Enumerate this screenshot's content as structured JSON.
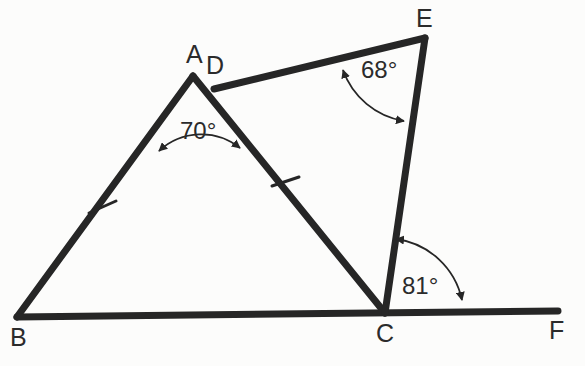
{
  "figure": {
    "type": "geometry-diagram",
    "background_color": "#fcfcfb",
    "stroke_color": "#262626",
    "text_color": "#2b2b2b",
    "canvas": {
      "width": 585,
      "height": 366
    },
    "vertices": [
      {
        "id": "A",
        "label": "A",
        "x": 193,
        "y": 76
      },
      {
        "id": "B",
        "label": "B",
        "x": 17,
        "y": 317
      },
      {
        "id": "C",
        "label": "C",
        "x": 385,
        "y": 313
      },
      {
        "id": "D",
        "label": "D",
        "x": 214,
        "y": 89
      },
      {
        "id": "E",
        "label": "E",
        "x": 425,
        "y": 38
      },
      {
        "id": "F",
        "label": "F",
        "x": 558,
        "y": 311
      }
    ],
    "segments": [
      {
        "name": "segment-BA",
        "from": "B",
        "to": "A"
      },
      {
        "name": "segment-AC",
        "from": "A",
        "to": "C"
      },
      {
        "name": "segment-BF",
        "from": "B",
        "to": "F"
      },
      {
        "name": "segment-DE",
        "from": "D",
        "to": "E"
      },
      {
        "name": "segment-EC",
        "from": "E",
        "to": "C"
      }
    ],
    "tick_marks": [
      {
        "name": "tick-BA",
        "on": "segment-BA",
        "x": 102,
        "y": 207,
        "count": 1
      },
      {
        "name": "tick-DC",
        "on": "segment-AC",
        "x": 285,
        "y": 182,
        "count": 1
      }
    ],
    "angles": [
      {
        "id": "angle-ADB",
        "label": "70°",
        "value": 70,
        "unit": "degrees",
        "at_vertex": "A",
        "label_x": 203,
        "label_y": 131
      },
      {
        "id": "angle-DEC",
        "label": "68°",
        "value": 68,
        "unit": "degrees",
        "at_vertex": "E",
        "label_x": 387,
        "label_y": 70
      },
      {
        "id": "angle-ECF",
        "label": "81°",
        "value": 81,
        "unit": "degrees",
        "at_vertex": "C",
        "label_x": 425,
        "label_y": 286
      }
    ]
  },
  "labels": {
    "A": "A",
    "B": "B",
    "C": "C",
    "D": "D",
    "E": "E",
    "F": "F",
    "angle_70": "70°",
    "angle_68": "68°",
    "angle_81": "81°"
  }
}
